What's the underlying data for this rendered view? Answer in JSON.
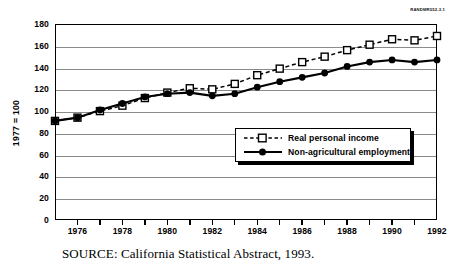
{
  "report_id": "RANDMR552-3.1",
  "caption": "SOURCE:  California Statistical Abstract, 1993.",
  "legend": {
    "position": "center-right-inside",
    "items": [
      {
        "label": "Real personal income",
        "marker": "open-square",
        "line": "dashed",
        "color": "#000000"
      },
      {
        "label": "Non-agricultural employment",
        "marker": "filled-circle",
        "line": "solid",
        "color": "#000000"
      }
    ]
  },
  "chart_data": {
    "type": "line",
    "title": "",
    "subtitle": "",
    "xlabel": "",
    "ylabel": "1977 = 100",
    "xlim": [
      1975,
      1992
    ],
    "ylim": [
      0,
      180
    ],
    "ytick_step": 20,
    "yticks": [
      0,
      20,
      40,
      60,
      80,
      100,
      120,
      140,
      160,
      180
    ],
    "ytick_labels": [
      "0",
      "20",
      "40",
      "60",
      "80",
      "100",
      "120",
      "140",
      "160",
      "180"
    ],
    "x": [
      1975,
      1976,
      1977,
      1978,
      1979,
      1980,
      1981,
      1982,
      1983,
      1984,
      1985,
      1986,
      1987,
      1988,
      1989,
      1990,
      1991,
      1992
    ],
    "xticks_minor": [
      1975,
      1976,
      1977,
      1978,
      1979,
      1980,
      1981,
      1982,
      1983,
      1984,
      1985,
      1986,
      1987,
      1988,
      1989,
      1990,
      1991,
      1992
    ],
    "xtick_labels": [
      "1976",
      "1978",
      "1980",
      "1982",
      "1984",
      "1986",
      "1988",
      "1990",
      "1992"
    ],
    "xtick_label_values": [
      1976,
      1978,
      1980,
      1982,
      1984,
      1986,
      1988,
      1990,
      1992
    ],
    "grid": true,
    "grid_axis": "y",
    "legend_position": "center-right",
    "series": [
      {
        "name": "Real personal income",
        "marker": "open-square",
        "linestyle": "dashed",
        "color": "#000000",
        "values": [
          91,
          94,
          100,
          105,
          112,
          117,
          121,
          120,
          125,
          133,
          139,
          145,
          150,
          156,
          161,
          166,
          165,
          169
        ]
      },
      {
        "name": "Non-agricultural employment",
        "marker": "filled-circle",
        "linestyle": "solid",
        "color": "#000000",
        "values": [
          91,
          94,
          101,
          107,
          113,
          116,
          117,
          114,
          116,
          122,
          127,
          131,
          135,
          141,
          145,
          147,
          145,
          147
        ]
      }
    ]
  }
}
